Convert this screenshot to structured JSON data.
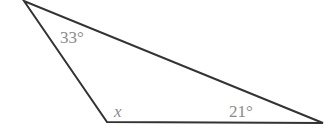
{
  "diagram": {
    "type": "triangle",
    "vertices": {
      "top": [
        24,
        1
      ],
      "bottom_left": [
        107,
        122
      ],
      "right": [
        323,
        123
      ]
    },
    "stroke_color": "#333333",
    "label_color": "#8a8a8a",
    "angles": [
      {
        "vertex": "top",
        "label": "33°"
      },
      {
        "vertex": "bottom_left",
        "label": "x"
      },
      {
        "vertex": "right",
        "label": "21°"
      }
    ]
  }
}
